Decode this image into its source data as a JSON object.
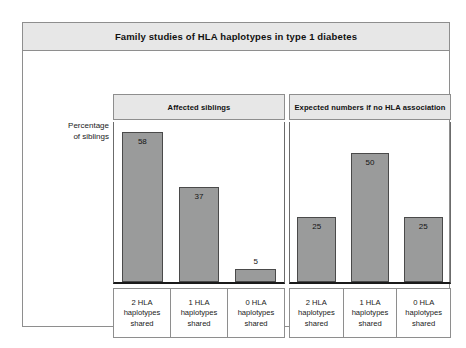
{
  "figure": {
    "title": "Family studies of HLA haplotypes in type 1 diabetes",
    "y_axis_caption_line1": "Percentage",
    "y_axis_caption_line2": "of siblings",
    "colors": {
      "bar_fill": "#9a9b9b",
      "bar_stroke": "#4a4a4a",
      "header_band": "#e7e7e7",
      "frame": "#8e8e8e",
      "text": "#1a1a1a",
      "background": "#ffffff"
    }
  },
  "chart_data": {
    "type": "bar",
    "title": "Family studies of HLA haplotypes in type 1 diabetes",
    "xlabel": "",
    "ylabel": "Percentage of siblings",
    "ylim": [
      0,
      62
    ],
    "grid": false,
    "legend": "none",
    "panels": [
      {
        "name": "Affected siblings",
        "header": "Affected siblings",
        "categories": [
          "2 HLA haplotypes shared",
          "1 HLA haplotypes shared",
          "0 HLA haplotypes shared"
        ],
        "category_lines": [
          [
            "2 HLA",
            "haplotypes",
            "shared"
          ],
          [
            "1 HLA",
            "haplotypes",
            "shared"
          ],
          [
            "0 HLA",
            "haplotypes",
            "shared"
          ]
        ],
        "values": [
          58,
          37,
          5
        ],
        "value_labels": [
          "58",
          "37",
          "5"
        ],
        "label_placement": [
          "inside",
          "inside",
          "outside"
        ]
      },
      {
        "name": "Expected numbers if no HLA association",
        "header": "Expected numbers if no HLA association",
        "categories": [
          "2 HLA haplotypes shared",
          "1 HLA haplotypes shared",
          "0 HLA haplotypes shared"
        ],
        "category_lines": [
          [
            "2 HLA",
            "haplotypes",
            "shared"
          ],
          [
            "1 HLA",
            "haplotypes",
            "shared"
          ],
          [
            "0 HLA",
            "haplotypes",
            "shared"
          ]
        ],
        "values": [
          25,
          50,
          25
        ],
        "value_labels": [
          "25",
          "50",
          "25"
        ],
        "label_placement": [
          "inside",
          "inside",
          "inside"
        ]
      }
    ]
  }
}
